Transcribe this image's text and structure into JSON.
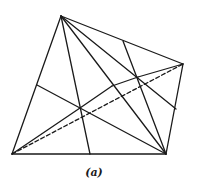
{
  "figure": {
    "caption": "(a)",
    "stroke_color": "#1a1a1a",
    "background": "#ffffff",
    "vertices": {
      "top": [
        61,
        16
      ],
      "right": [
        183,
        64
      ],
      "bottom_right": [
        166,
        154
      ],
      "bottom_left": [
        12,
        154
      ],
      "left_edge_point": [
        37,
        85
      ],
      "top_edge_point": [
        123,
        41
      ],
      "right_edge_point": [
        176,
        109
      ],
      "bottom_edge_point": [
        90,
        154
      ],
      "inner_a": [
        80,
        108
      ],
      "inner_b": [
        112,
        86
      ],
      "inner_c": [
        138,
        77
      ]
    },
    "solid_segments": [
      [
        [
          61,
          16
        ],
        [
          183,
          64
        ]
      ],
      [
        [
          183,
          64
        ],
        [
          166,
          154
        ]
      ],
      [
        [
          166,
          154
        ],
        [
          12,
          154
        ]
      ],
      [
        [
          12,
          154
        ],
        [
          61,
          16
        ]
      ],
      [
        [
          61,
          16
        ],
        [
          90,
          154
        ]
      ],
      [
        [
          61,
          16
        ],
        [
          166,
          154
        ]
      ],
      [
        [
          61,
          16
        ],
        [
          176,
          109
        ]
      ],
      [
        [
          37,
          85
        ],
        [
          166,
          154
        ]
      ],
      [
        [
          123,
          41
        ],
        [
          166,
          154
        ]
      ],
      [
        [
          12,
          154
        ],
        [
          80,
          108
        ]
      ],
      [
        [
          80,
          108
        ],
        [
          112,
          86
        ]
      ],
      [
        [
          112,
          86
        ],
        [
          138,
          77
        ]
      ],
      [
        [
          138,
          77
        ],
        [
          183,
          64
        ]
      ]
    ],
    "dashed_segments": [
      [
        [
          12,
          154
        ],
        [
          183,
          64
        ]
      ]
    ]
  }
}
